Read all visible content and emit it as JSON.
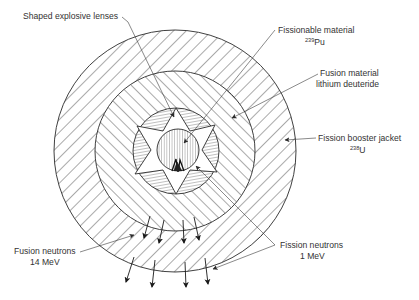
{
  "diagram": {
    "labels": {
      "lenses": "Shaped explosive lenses",
      "fissionable_line1": "Fissionable material",
      "fissionable_sup": "239",
      "fissionable_elem": "Pu",
      "fusion_line1": "Fusion material",
      "fusion_line2": "lithium deuteride",
      "jacket_line1": "Fission booster jacket",
      "jacket_sup": "238",
      "jacket_elem": "U",
      "fusion_neutrons_line1": "Fusion neutrons",
      "fusion_neutrons_line2": "14 MeV",
      "fission_neutrons_line1": "Fission neutrons",
      "fission_neutrons_line2": "1 MeV"
    },
    "layers": [
      {
        "name": "Fission booster jacket (238U)",
        "radius_px": 121
      },
      {
        "name": "Fusion material (lithium deuteride)",
        "radius_px": 80
      },
      {
        "name": "Shaped explosive lenses",
        "radius_px": 43
      },
      {
        "name": "Fissionable material (239Pu)",
        "radius_px": 21
      }
    ],
    "colors": {
      "line": "#2a2a2a",
      "text": "#333333",
      "background": "#ffffff"
    }
  }
}
